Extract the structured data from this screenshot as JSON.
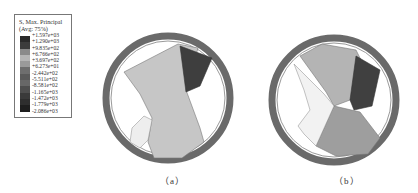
{
  "legend": {
    "title_line1": "S, Max. Principal",
    "title_line2": "(Avg: 75%)",
    "ticks": [
      "+1.597e+03",
      "+1.290e+03",
      "+9.835e+02",
      "+6.766e+02",
      "+3.697e+02",
      "+6.273e+01",
      "-2.442e+02",
      "-5.511e+02",
      "-8.581e+02",
      "-1.165e+03",
      "-1.472e+03",
      "-1.779e+03",
      "-2.086e+03"
    ],
    "colors": [
      "#2a2a2a",
      "#3c3c3c",
      "#8a8a8a",
      "#b5b5b5",
      "#9a9a9a",
      "#6e6e6e",
      "#5a5a5a",
      "#676767",
      "#4e4e4e",
      "#3a3a3a",
      "#2e2e2e",
      "#1e1e1e"
    ]
  },
  "panels": {
    "a": {
      "caption": "（a）"
    },
    "b": {
      "caption": "（b）"
    }
  },
  "colors": {
    "ring": "#6a6a6a",
    "ring_inner": "#8c8c8c",
    "light_region": "#c4c4c4",
    "dark_region": "#3e3e3e",
    "mid_region": "#a8a8a8"
  }
}
